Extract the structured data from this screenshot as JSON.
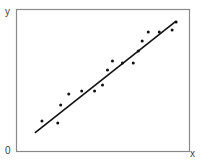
{
  "chart_data": {
    "type": "scatter",
    "title": "",
    "xlabel": "x",
    "ylabel": "y",
    "origin_label": "0",
    "grid": false,
    "legend": null,
    "xlim": [
      0,
      100
    ],
    "ylim": [
      0,
      100
    ],
    "points": [
      {
        "x": 14.5,
        "y": 21.1
      },
      {
        "x": 23.7,
        "y": 19.7
      },
      {
        "x": 25.4,
        "y": 32.4
      },
      {
        "x": 30.1,
        "y": 40.1
      },
      {
        "x": 37.6,
        "y": 42.3
      },
      {
        "x": 45.1,
        "y": 42.3
      },
      {
        "x": 49.7,
        "y": 46.5
      },
      {
        "x": 52.6,
        "y": 57.0
      },
      {
        "x": 55.5,
        "y": 63.4
      },
      {
        "x": 61.3,
        "y": 62.0
      },
      {
        "x": 67.6,
        "y": 62.0
      },
      {
        "x": 70.5,
        "y": 70.4
      },
      {
        "x": 72.8,
        "y": 77.5
      },
      {
        "x": 76.3,
        "y": 83.8
      },
      {
        "x": 82.7,
        "y": 83.8
      },
      {
        "x": 90.2,
        "y": 85.2
      },
      {
        "x": 92.5,
        "y": 90.8
      }
    ],
    "fit_line": {
      "x": [
        10.4,
        92.5
      ],
      "y": [
        12.7,
        91.5
      ]
    }
  },
  "labels": {
    "y_axis": "y",
    "x_axis": "x",
    "origin": "0"
  }
}
